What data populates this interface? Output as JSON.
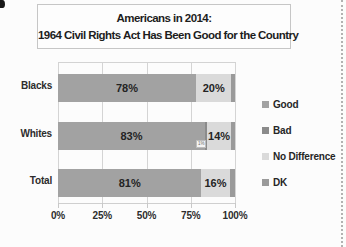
{
  "title": {
    "line1": "Americans in 2014:",
    "line2": "1964 Civil Rights Act Has Been Good for the Country"
  },
  "chart_data": {
    "type": "bar",
    "stacked": true,
    "orientation": "horizontal",
    "title": "Americans in 2014: 1964 Civil Rights Act Has Been Good for the Country",
    "categories": [
      "Blacks",
      "Whites",
      "Total"
    ],
    "series": [
      {
        "name": "Good",
        "color": "#a2a2a2",
        "values": [
          78,
          83,
          81
        ]
      },
      {
        "name": "Bad",
        "color": "#8b8b8b",
        "values": [
          0,
          1,
          0
        ]
      },
      {
        "name": "No Difference",
        "color": "#dadada",
        "values": [
          20,
          14,
          16
        ]
      },
      {
        "name": "DK",
        "color": "#9a9a9a",
        "values": [
          2,
          2,
          3
        ]
      }
    ],
    "data_labels": {
      "Good": [
        "78%",
        "83%",
        "81%"
      ],
      "No Difference": [
        "20%",
        "14%",
        "16%"
      ]
    },
    "x_ticks": [
      "0%",
      "25%",
      "50%",
      "75%",
      "100%"
    ],
    "xlim": [
      0,
      100
    ],
    "grid": "vertical",
    "legend": [
      "Good",
      "Bad",
      "No Difference",
      "DK"
    ],
    "legend_position": "right",
    "callout": {
      "category": "Whites",
      "text": "1%"
    }
  }
}
